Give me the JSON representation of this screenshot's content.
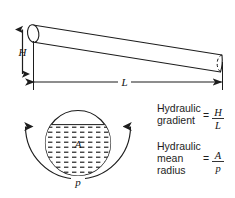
{
  "figure": {
    "stroke_color": "#1d1d1d",
    "fill_color": "#ffffff",
    "hatch_color": "#2b2b2b",
    "pipe": {
      "name": "inclined pipe",
      "left_cap": "solid-ellipse",
      "right_cap": "dashed-ellipse"
    },
    "dimensions": {
      "height_label": "H",
      "length_label": "L"
    },
    "cross_section": {
      "area_label": "A",
      "perimeter_label": "p"
    }
  },
  "formulas": [
    {
      "id": "hydraulic-gradient",
      "lines": [
        "Hydraulic",
        "gradient"
      ],
      "equals": "=",
      "numerator": "H",
      "denominator": "L"
    },
    {
      "id": "hydraulic-mean-radius",
      "lines": [
        "Hydraulic",
        "mean",
        "radius"
      ],
      "equals": "=",
      "numerator": "A",
      "denominator": "p"
    }
  ]
}
